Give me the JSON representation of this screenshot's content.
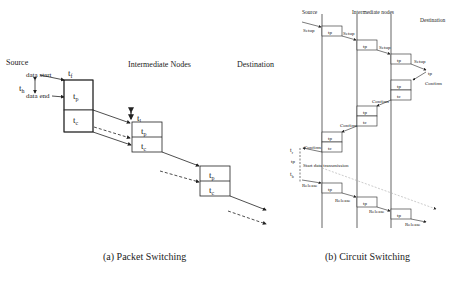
{
  "packet": {
    "source": "Source",
    "intermediate": "Intermediate Nodes",
    "destination": "Destination",
    "data_start": "data start",
    "data_end": "data end",
    "th": "t",
    "th_sub": "h",
    "tf": "t",
    "tf_sub": "f",
    "tl": "t",
    "tl_sub": "l",
    "tp": "t",
    "tp_sub": "p",
    "tc": "t",
    "tc_sub": "c",
    "caption": "(a) Packet Switching"
  },
  "circuit": {
    "source": "Source",
    "intermediate": "Intermediate nodes",
    "destination": "Destination",
    "setup": "Setup",
    "confirm": "Confirm",
    "release": "Release",
    "start_data": "Start data transmission",
    "tp": "tp",
    "tc": "tc",
    "tr": "t",
    "tr_sub": "r",
    "tp_left": "tp",
    "tb": "t",
    "tb_sub": "b",
    "caption": "(b) Circuit Switching"
  }
}
